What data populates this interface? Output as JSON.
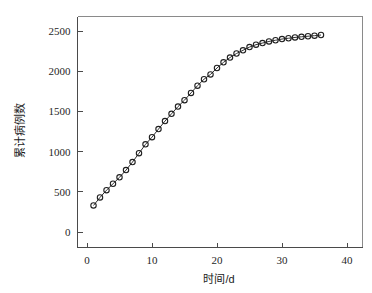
{
  "chart_data": {
    "type": "line",
    "title": "",
    "subtitle": "",
    "xlabel": "时间/d",
    "ylabel": "累计病例数",
    "xlim": [
      0,
      42
    ],
    "ylim": [
      -120,
      2600
    ],
    "xticks": [
      0,
      10,
      20,
      30,
      40
    ],
    "yticks": [
      0,
      500,
      1000,
      1500,
      2000,
      2500
    ],
    "xtick_labels": [
      "0",
      "10",
      "20",
      "30",
      "40"
    ],
    "ytick_labels": [
      "0",
      "500",
      "1000",
      "1500",
      "2000",
      "2500"
    ],
    "grid": false,
    "legend": null,
    "legend_position": "none",
    "marker": "open-circle",
    "line_color": "#2b2b2b",
    "marker_edge_color": "#1f1f1f",
    "marker_face_color": "#ffffff",
    "x": [
      1,
      2,
      3,
      4,
      5,
      6,
      7,
      8,
      9,
      10,
      11,
      12,
      13,
      14,
      15,
      16,
      17,
      18,
      19,
      20,
      21,
      22,
      23,
      24,
      25,
      26,
      27,
      28,
      29,
      30,
      31,
      32,
      33,
      34,
      35,
      36
    ],
    "values": [
      330,
      430,
      520,
      600,
      680,
      770,
      870,
      980,
      1090,
      1180,
      1280,
      1380,
      1470,
      1560,
      1640,
      1730,
      1820,
      1900,
      1960,
      2040,
      2110,
      2170,
      2220,
      2260,
      2300,
      2330,
      2350,
      2370,
      2385,
      2400,
      2410,
      2420,
      2428,
      2435,
      2442,
      2450
    ],
    "series": [
      {
        "name": "累计病例数",
        "values": [
          330,
          430,
          520,
          600,
          680,
          770,
          870,
          980,
          1090,
          1180,
          1280,
          1380,
          1470,
          1560,
          1640,
          1730,
          1820,
          1900,
          1960,
          2040,
          2110,
          2170,
          2220,
          2260,
          2300,
          2330,
          2350,
          2370,
          2385,
          2400,
          2410,
          2420,
          2428,
          2435,
          2442,
          2450
        ]
      }
    ]
  }
}
